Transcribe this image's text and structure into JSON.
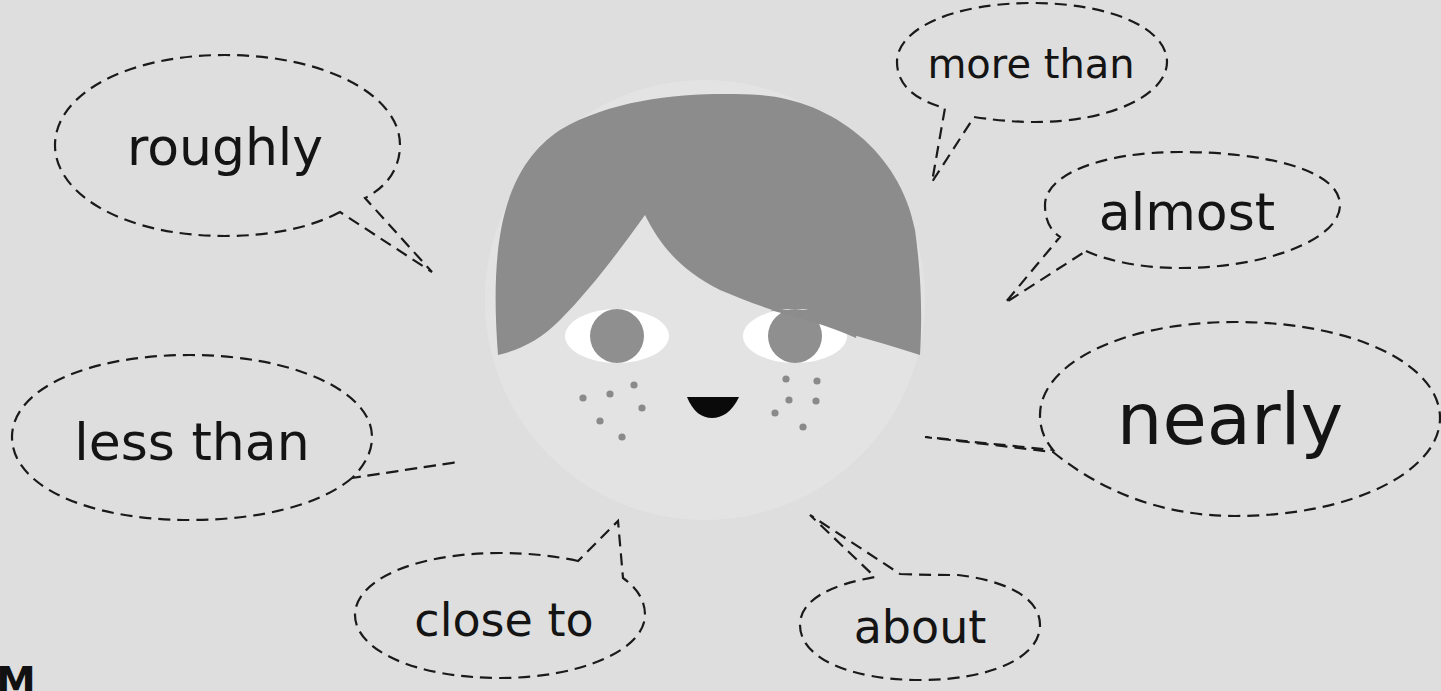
{
  "illustration": {
    "subject": "cartoon-face-with-speech-bubbles",
    "colors": {
      "background": "#dedede",
      "face": "#e3e3e3",
      "hair": "#8c8c8c",
      "eye_white": "#ffffff",
      "iris": "#8f8f8f",
      "freckles": "#8a8a8a",
      "mouth": "#0a0a0a",
      "outline": "#1a1a1a"
    }
  },
  "bubbles": [
    {
      "id": "roughly",
      "text": "roughly"
    },
    {
      "id": "more-than",
      "text": "more than"
    },
    {
      "id": "almost",
      "text": "almost"
    },
    {
      "id": "nearly",
      "text": "nearly"
    },
    {
      "id": "less-than",
      "text": "less than"
    },
    {
      "id": "close-to",
      "text": "close to"
    },
    {
      "id": "about",
      "text": "about"
    }
  ],
  "corner_fragment": "M"
}
